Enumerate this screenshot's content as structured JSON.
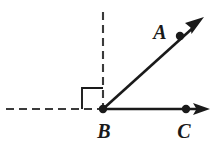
{
  "diagram": {
    "background_color": "#ffffff",
    "stroke_color": "#1a1a1a",
    "dash_color": "#3a3a3a",
    "width": 219,
    "height": 150,
    "vertex": {
      "name": "B",
      "label": "B",
      "x": 103,
      "y": 109,
      "label_x": 104,
      "label_y": 138
    },
    "points": [
      {
        "name": "A",
        "label": "A",
        "dot_x": 180,
        "dot_y": 36,
        "label_x": 160,
        "label_y": 39
      },
      {
        "name": "C",
        "label": "C",
        "dot_x": 186,
        "dot_y": 109,
        "label_x": 184,
        "label_y": 138
      }
    ],
    "rays": [
      {
        "name": "ray-BA",
        "from": "B",
        "through": "A",
        "x1": 103,
        "y1": 109,
        "x2": 198,
        "y2": 23,
        "style": "solid",
        "arrow": true
      },
      {
        "name": "ray-BC",
        "from": "B",
        "through": "C",
        "x1": 103,
        "y1": 109,
        "x2": 200,
        "y2": 109,
        "style": "solid",
        "arrow": true
      }
    ],
    "reference_lines": [
      {
        "name": "horizontal-dashed-line",
        "x1": 6,
        "y1": 109,
        "x2": 103,
        "y2": 109,
        "style": "dashed",
        "dash_pattern": "8 5"
      },
      {
        "name": "vertical-dashed-line",
        "x1": 103,
        "y1": 12,
        "x2": 103,
        "y2": 109,
        "style": "dashed",
        "dash_pattern": "8 5"
      }
    ],
    "right_angle_mark": {
      "name": "right-angle-square",
      "x": 82,
      "y": 88,
      "size": 21,
      "description": "square marker between horizontal dashed ray and vertical dashed ray"
    }
  }
}
